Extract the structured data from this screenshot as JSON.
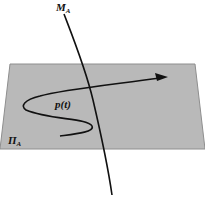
{
  "diagram": {
    "labels": {
      "manifold": {
        "main": "M",
        "sub": "A"
      },
      "plane": {
        "main": "Π",
        "sub": "A"
      },
      "curve": "p(t)"
    },
    "colors": {
      "plane_fill": "#b8b8b8",
      "plane_edge": "#8c8c8c",
      "curve": "#111111",
      "background": "#ffffff"
    }
  }
}
